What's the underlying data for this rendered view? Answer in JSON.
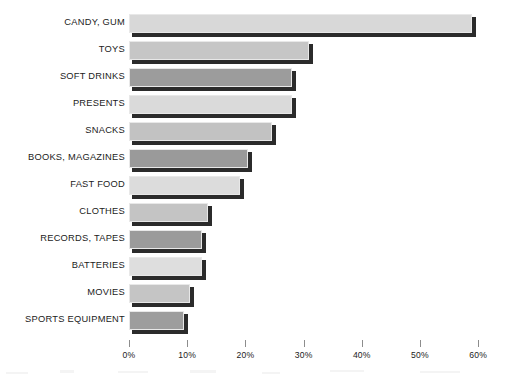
{
  "chart_data": {
    "type": "bar",
    "orientation": "horizontal",
    "title": "",
    "xlabel": "",
    "ylabel": "",
    "xlim": [
      0,
      60
    ],
    "grid": false,
    "legend": false,
    "tick_labels": [
      "0%",
      "10%",
      "20%",
      "30%",
      "40%",
      "50%",
      "60%"
    ],
    "tick_values": [
      0,
      10,
      20,
      30,
      40,
      50,
      60
    ],
    "categories": [
      "CANDY, GUM",
      "TOYS",
      "SOFT DRINKS",
      "PRESENTS",
      "SNACKS",
      "BOOKS, MAGAZINES",
      "FAST FOOD",
      "CLOTHES",
      "RECORDS, TAPES",
      "BATTERIES",
      "MOVIES",
      "SPORTS EQUIPMENT"
    ],
    "values": [
      59,
      31,
      28,
      28,
      24.5,
      20.5,
      19,
      13.5,
      12.5,
      12.5,
      10.5,
      9.5
    ],
    "bar_colors": [
      "#d8d8d8",
      "#c6c6c6",
      "#9c9c9c",
      "#dadada",
      "#c2c2c2",
      "#9a9a9a",
      "#dcdcdc",
      "#c4c4c4",
      "#9b9b9b",
      "#dedede",
      "#c5c5c5",
      "#9d9d9d"
    ],
    "shadow_color": "#2b2b2b",
    "tick_color": "#8d8d8d",
    "text_color": "#1b1b1b",
    "background_color": "#ffffff"
  }
}
